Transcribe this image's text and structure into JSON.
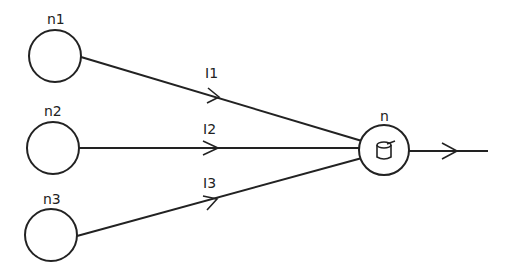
{
  "diagram": {
    "type": "perceptron / neuron diagram",
    "input_nodes": [
      {
        "id": "n1",
        "label": "n1",
        "cx": 55,
        "cy": 56,
        "r": 26
      },
      {
        "id": "n2",
        "label": "n2",
        "cx": 53,
        "cy": 148,
        "r": 26
      },
      {
        "id": "n3",
        "label": "n3",
        "cx": 51,
        "cy": 235,
        "r": 26
      }
    ],
    "output_node": {
      "id": "n",
      "label": "n",
      "inner_symbol": "θ",
      "cx": 384,
      "cy": 150,
      "r": 25
    },
    "edges": [
      {
        "from": "n1",
        "to": "n",
        "label": "I1"
      },
      {
        "from": "n2",
        "to": "n",
        "label": "I2"
      },
      {
        "from": "n3",
        "to": "n",
        "label": "I3"
      }
    ],
    "output_edge": {
      "from": "n",
      "label": ""
    },
    "colors": {
      "stroke": "#222222",
      "background": "#ffffff"
    }
  }
}
